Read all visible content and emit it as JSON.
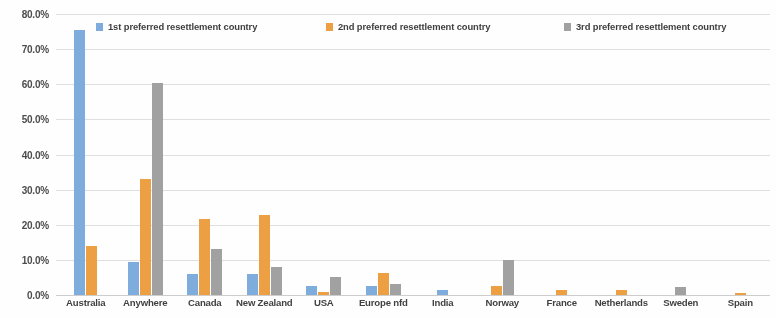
{
  "chart_data": {
    "type": "bar",
    "title": "",
    "xlabel": "",
    "ylabel": "",
    "ylim": [
      0,
      80
    ],
    "ytick_labels": [
      "0.0%",
      "10.0%",
      "20.0%",
      "30.0%",
      "40.0%",
      "50.0%",
      "60.0%",
      "70.0%",
      "80.0%"
    ],
    "ytick_values": [
      0,
      10,
      20,
      30,
      40,
      50,
      60,
      70,
      80
    ],
    "grid": true,
    "legend_position": "top",
    "categories": [
      "Australia",
      "Anywhere",
      "Canada",
      "New Zealand",
      "USA",
      "Europe nfd",
      "India",
      "Norway",
      "France",
      "Netherlands",
      "Sweden",
      "Spain"
    ],
    "series": [
      {
        "name": "1st preferred resettlement country",
        "color": "#7CAEE3",
        "values": [
          75.5,
          9.5,
          6.0,
          6.0,
          2.5,
          2.5,
          1.3,
          0,
          0,
          0,
          0,
          0
        ]
      },
      {
        "name": "2nd preferred resettlement country",
        "color": "#F4A03C",
        "values": [
          14.0,
          33.0,
          21.5,
          22.8,
          1.0,
          6.3,
          0,
          2.7,
          1.3,
          1.3,
          0,
          0.5
        ]
      },
      {
        "name": "3rd preferred resettlement country",
        "color": "#A2A2A2",
        "values": [
          0,
          60.5,
          13.0,
          8.0,
          5.0,
          3.0,
          0,
          10.0,
          0,
          0,
          2.3,
          0
        ]
      }
    ]
  },
  "legend": {
    "items": [
      {
        "label": "1st preferred resettlement country",
        "color": "#7CAEE3",
        "left": 0
      },
      {
        "label": "2nd preferred resettlement country",
        "color": "#F4A03C",
        "left": 230
      },
      {
        "label": "3rd preferred resettlement country",
        "color": "#A2A2A2",
        "left": 468
      }
    ]
  }
}
